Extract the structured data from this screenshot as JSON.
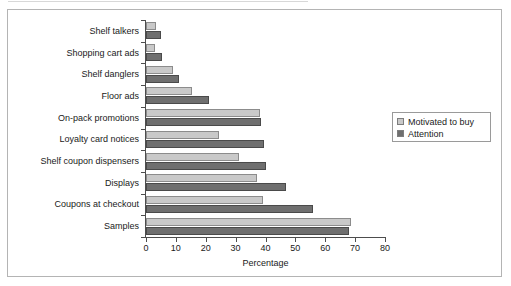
{
  "chart_data": {
    "type": "bar",
    "orientation": "horizontal",
    "title": "",
    "xlabel": "Percentage",
    "ylabel": "",
    "xlim": [
      0,
      80
    ],
    "xticks": [
      0,
      10,
      20,
      30,
      40,
      50,
      60,
      70,
      80
    ],
    "grid": false,
    "legend_position": "right",
    "categories": [
      "Shelf talkers",
      "Shopping cart ads",
      "Shelf danglers",
      "Floor ads",
      "On-pack promotions",
      "Loyalty card notices",
      "Shelf coupon dispensers",
      "Displays",
      "Coupons at checkout",
      "Samples"
    ],
    "series": [
      {
        "name": "Motivated to buy",
        "color": "#c9c9c9",
        "values": [
          3.5,
          3,
          9,
          15.5,
          38,
          24.5,
          31,
          37,
          39,
          68.5
        ]
      },
      {
        "name": "Attention",
        "color": "#6f6f6f",
        "values": [
          5,
          5.5,
          11,
          21,
          38.5,
          39.5,
          40,
          47,
          56,
          68
        ]
      }
    ]
  },
  "legend": {
    "items": [
      {
        "label": "Motivated to buy",
        "swatch": "motivated"
      },
      {
        "label": "Attention",
        "swatch": "attention"
      }
    ]
  },
  "axis": {
    "x_title": "Percentage",
    "tick_labels": [
      "0",
      "10",
      "20",
      "30",
      "40",
      "50",
      "60",
      "70",
      "80"
    ]
  }
}
